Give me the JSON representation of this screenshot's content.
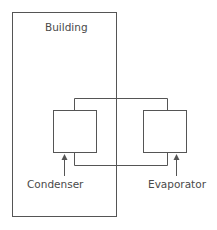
{
  "diagram": {
    "labels": {
      "building": "Building",
      "condenser": "Condenser",
      "evaporator": "Evaporator"
    },
    "colors": {
      "stroke": "#555555",
      "text": "#4a4a4a",
      "background": "#ffffff"
    }
  }
}
